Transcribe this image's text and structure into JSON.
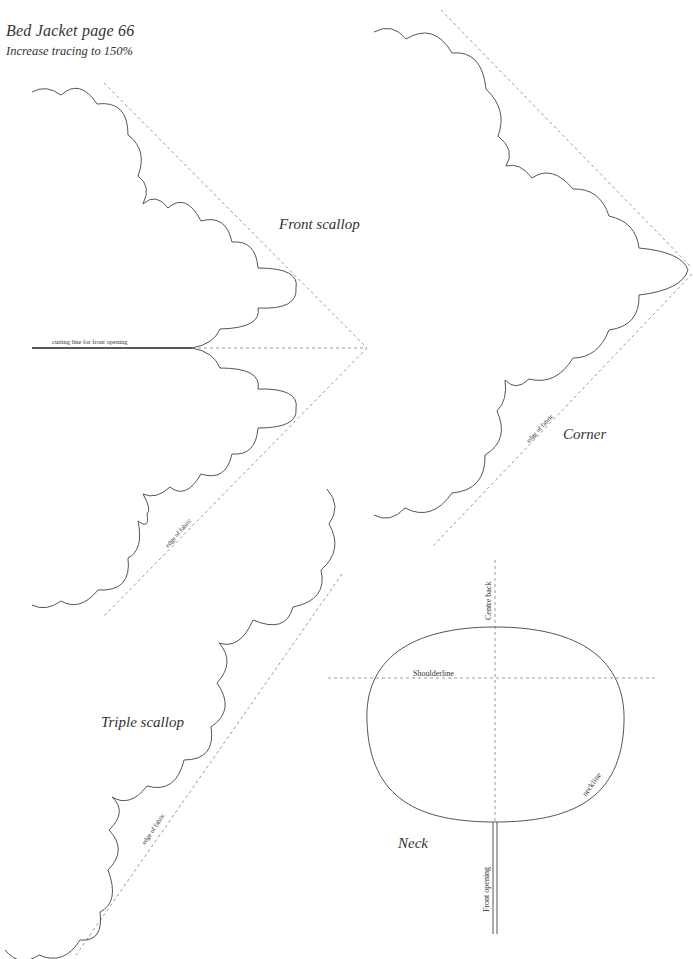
{
  "header": {
    "title": "Bed Jacket page 66",
    "instruction": "Increase tracing to 150%"
  },
  "pieces": {
    "front_scallop": {
      "name": "Front scallop",
      "cutting_line_label": "cutting line for front opening",
      "edge_label": "edge of fabric"
    },
    "corner": {
      "name": "Corner",
      "edge_label": "edge of fabric"
    },
    "triple_scallop": {
      "name": "Triple scallop",
      "edge_label": "edge of fabric"
    },
    "neck": {
      "name": "Neck",
      "centre_back_label": "Centre back",
      "shoulderline_label": "Shoulderline",
      "neckline_label": "neckline",
      "front_opening_label": "Front opening"
    }
  },
  "colors": {
    "outline": "#555555",
    "fold_line": "#9a9a9a",
    "cutting_line": "#222222",
    "background": "#ffffff"
  }
}
